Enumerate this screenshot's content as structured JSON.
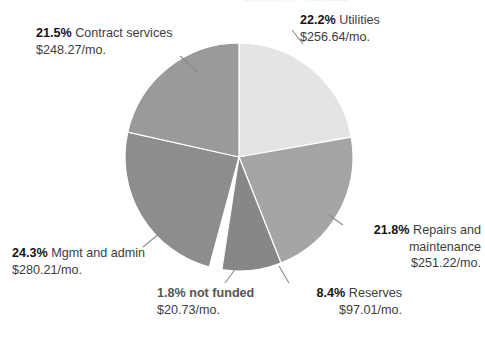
{
  "title_remnant": "Annual Expenses",
  "chart_data": {
    "type": "pie",
    "title": "Annual Expenses",
    "xlabel": "",
    "ylabel": "",
    "legend_position": "none",
    "grid": false,
    "start_angle_deg": 0,
    "direction": "clockwise",
    "center": {
      "x": 239,
      "y": 157
    },
    "radius": 114,
    "categories": [
      "Utilities",
      "Repairs and maintenance",
      "Reserves",
      "not funded",
      "Mgmt and admin",
      "Contract services"
    ],
    "values": [
      22.2,
      21.8,
      8.4,
      1.8,
      24.3,
      21.5
    ],
    "amounts": [
      256.64,
      251.22,
      97.01,
      20.73,
      280.21,
      248.27
    ],
    "amount_labels": [
      "$256.64/mo.",
      "$251.22/mo.",
      "$97.01/mo.",
      "$20.73/mo.",
      "$280.21/mo.",
      "$248.27/mo."
    ],
    "percent_labels": [
      "22.2%",
      "21.8%",
      "8.4%",
      "1.8%",
      "24.3%",
      "21.5%"
    ],
    "colors": [
      "#e4e4e4",
      "#a5a5a5",
      "#878787",
      "#ffffff",
      "#8d8d8d",
      "#9a9a9a"
    ],
    "slice_stroke": "#ffffff",
    "exploded_slices": [
      "not funded"
    ]
  },
  "slices": [
    {
      "key": "utilities",
      "percent": "22.2%",
      "name": "Utilities",
      "amount": "$256.64/mo.",
      "color": "#e4e4e4"
    },
    {
      "key": "repairs",
      "percent": "21.8%",
      "name": "Repairs and",
      "name2": "maintenance",
      "amount": "$251.22/mo.",
      "color": "#a5a5a5"
    },
    {
      "key": "reserves",
      "percent": "8.4%",
      "name": "Reserves",
      "amount": "$97.01/mo.",
      "color": "#878787"
    },
    {
      "key": "notfunded",
      "percent": "1.8%",
      "name": "not funded",
      "amount": "$20.73/mo.",
      "color": "#ffffff"
    },
    {
      "key": "mgmt",
      "percent": "24.3%",
      "name": "Mgmt and admin",
      "amount": "$280.21/mo.",
      "color": "#8d8d8d"
    },
    {
      "key": "contract",
      "percent": "21.5%",
      "name": "Contract services",
      "amount": "$248.27/mo.",
      "color": "#9a9a9a"
    }
  ]
}
